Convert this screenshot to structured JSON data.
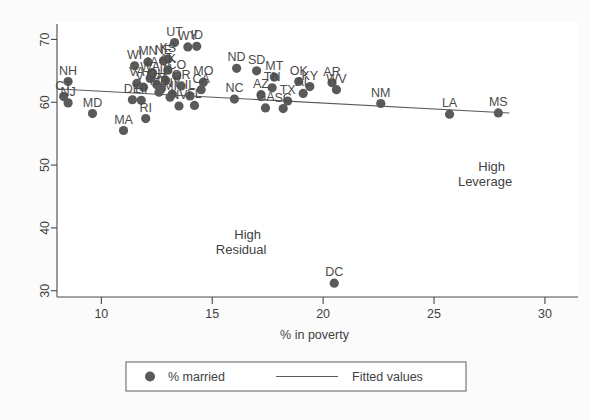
{
  "chart_data": {
    "type": "scatter",
    "title": "",
    "xlabel": "% in poverty",
    "ylabel": "",
    "xlim": [
      8.0,
      30.5
    ],
    "ylim": [
      29.0,
      71.5
    ],
    "xticks": [
      10,
      15,
      20,
      25,
      30
    ],
    "yticks": [
      30,
      40,
      50,
      60,
      70
    ],
    "grid": false,
    "legend": {
      "position": "bottom",
      "entries": [
        {
          "label": "% married",
          "marker": "circle"
        },
        {
          "label": "Fitted values",
          "marker": "line"
        }
      ]
    },
    "annotations": [
      {
        "text": "High",
        "x": 16.6,
        "y": 38.2
      },
      {
        "text": "Residual",
        "x": 16.3,
        "y": 35.8
      },
      {
        "text": "High",
        "x": 27.6,
        "y": 49.0
      },
      {
        "text": "Leverage",
        "x": 27.3,
        "y": 46.6
      }
    ],
    "series": [
      {
        "name": "% married",
        "points": [
          {
            "label": "NH",
            "x": 8.5,
            "y": 63.3
          },
          {
            "label": "CT",
            "x": 8.3,
            "y": 60.9
          },
          {
            "label": "NJ",
            "x": 8.5,
            "y": 59.9
          },
          {
            "label": "MD",
            "x": 9.6,
            "y": 58.2
          },
          {
            "label": "MA",
            "x": 11.0,
            "y": 55.5
          },
          {
            "label": "DE",
            "x": 11.4,
            "y": 60.4
          },
          {
            "label": "RI",
            "x": 12.0,
            "y": 57.4
          },
          {
            "label": "HI",
            "x": 11.8,
            "y": 60.3
          },
          {
            "label": "VA",
            "x": 11.6,
            "y": 63.0
          },
          {
            "label": "WI",
            "x": 11.5,
            "y": 65.8
          },
          {
            "label": "MN",
            "x": 12.1,
            "y": 66.4
          },
          {
            "label": "NE",
            "x": 12.8,
            "y": 66.6
          },
          {
            "label": "KS",
            "x": 13.0,
            "y": 66.9
          },
          {
            "label": "UT",
            "x": 13.3,
            "y": 69.5
          },
          {
            "label": "WY",
            "x": 13.9,
            "y": 68.8
          },
          {
            "label": "ID",
            "x": 14.3,
            "y": 68.9
          },
          {
            "label": "IA",
            "x": 12.3,
            "y": 64.7
          },
          {
            "label": "NY",
            "x": 13.2,
            "y": 61.3
          },
          {
            "label": "PA",
            "x": 12.7,
            "y": 62.1
          },
          {
            "label": "OH",
            "x": 12.5,
            "y": 62.8
          },
          {
            "label": "IN",
            "x": 12.9,
            "y": 63.5
          },
          {
            "label": "CO",
            "x": 13.4,
            "y": 64.2
          },
          {
            "label": "VT",
            "x": 11.9,
            "y": 62.4
          },
          {
            "label": "ME",
            "x": 12.6,
            "y": 61.6
          },
          {
            "label": "MI",
            "x": 13.1,
            "y": 60.8
          },
          {
            "label": "WA",
            "x": 12.2,
            "y": 63.8
          },
          {
            "label": "OR",
            "x": 13.6,
            "y": 62.6
          },
          {
            "label": "NV",
            "x": 13.5,
            "y": 59.4
          },
          {
            "label": "AK",
            "x": 13.0,
            "y": 65.1
          },
          {
            "label": "IL",
            "x": 14.0,
            "y": 61.0
          },
          {
            "label": "CA",
            "x": 14.5,
            "y": 62.0
          },
          {
            "label": "FL",
            "x": 14.2,
            "y": 59.5
          },
          {
            "label": "MO",
            "x": 14.6,
            "y": 63.2
          },
          {
            "label": "ND",
            "x": 16.1,
            "y": 65.4
          },
          {
            "label": "SD",
            "x": 17.0,
            "y": 65.0
          },
          {
            "label": "MT",
            "x": 17.8,
            "y": 64.0
          },
          {
            "label": "AZ",
            "x": 17.2,
            "y": 61.2
          },
          {
            "label": "TN",
            "x": 17.7,
            "y": 62.3
          },
          {
            "label": "NC",
            "x": 16.0,
            "y": 60.5
          },
          {
            "label": "GA",
            "x": 17.4,
            "y": 59.1
          },
          {
            "label": "SC",
            "x": 18.2,
            "y": 59.0
          },
          {
            "label": "OK",
            "x": 18.9,
            "y": 63.3
          },
          {
            "label": "KY",
            "x": 19.4,
            "y": 62.5
          },
          {
            "label": "AL",
            "x": 19.1,
            "y": 61.4
          },
          {
            "label": "AR",
            "x": 20.4,
            "y": 63.1
          },
          {
            "label": "WV",
            "x": 20.6,
            "y": 62.0
          },
          {
            "label": "TX",
            "x": 18.4,
            "y": 60.2
          },
          {
            "label": "DC",
            "x": 20.5,
            "y": 31.2
          },
          {
            "label": "NM",
            "x": 22.6,
            "y": 59.8
          },
          {
            "label": "LA",
            "x": 25.7,
            "y": 58.1
          },
          {
            "label": "MS",
            "x": 27.9,
            "y": 58.3
          }
        ]
      }
    ],
    "fit_line": {
      "x0": 8.1,
      "y0": 62.1,
      "x1": 28.4,
      "y1": 58.3
    }
  }
}
